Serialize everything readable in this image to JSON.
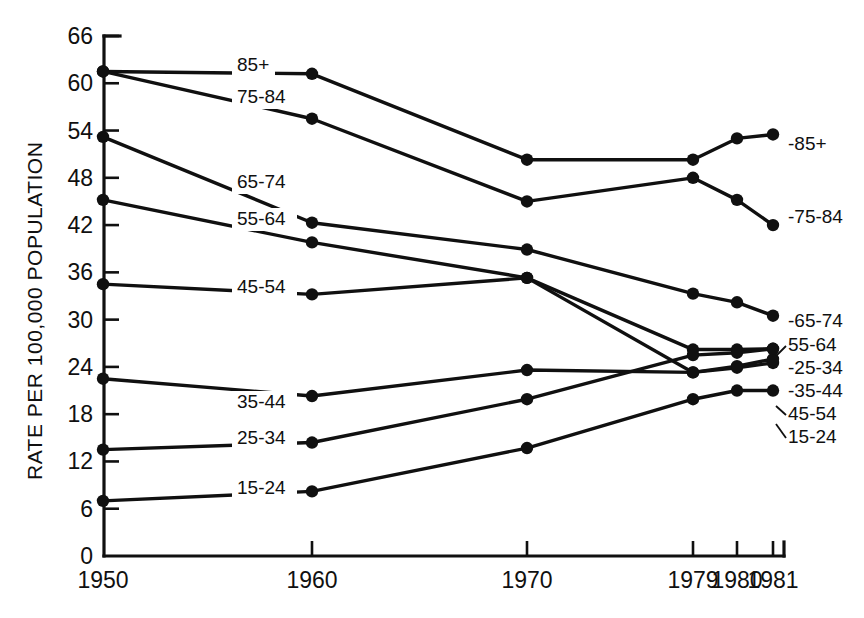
{
  "chart_data": {
    "type": "line",
    "title": "",
    "subtitle": "",
    "xlabel": "",
    "ylabel": "RATE PER 100,000 POPULATION",
    "x": [
      "1950",
      "1960",
      "1970",
      "1979",
      "1980",
      "1981"
    ],
    "xtick_labels": [
      "1950",
      "1960",
      "1970",
      "1979",
      "1980",
      "1981"
    ],
    "ytick_labels": [
      "0",
      "6",
      "12",
      "18",
      "24",
      "30",
      "36",
      "42",
      "48",
      "54",
      "60",
      "66"
    ],
    "ylim": [
      0,
      66
    ],
    "grid": false,
    "legend_position": "inline-and-right",
    "marker": "filled-circle",
    "line_color": "#101010",
    "series": [
      {
        "name": "85+",
        "inline_label": "85+",
        "right_label": "-85+",
        "values": [
          61.5,
          61.2,
          50.3,
          50.3,
          53.0,
          53.5
        ]
      },
      {
        "name": "75-84",
        "inline_label": "75-84",
        "right_label": "-75-84",
        "values": [
          61.5,
          55.5,
          45.0,
          48.0,
          45.2,
          42.0
        ]
      },
      {
        "name": "65-74",
        "inline_label": "65-74",
        "right_label": "-65-74",
        "values": [
          53.2,
          42.3,
          38.9,
          33.3,
          32.2,
          30.5
        ]
      },
      {
        "name": "55-64",
        "inline_label": "55-64",
        "right_label": "55-64",
        "values": [
          45.2,
          39.8,
          35.3,
          26.2,
          26.2,
          26.3
        ]
      },
      {
        "name": "45-54",
        "inline_label": "45-54",
        "right_label": "45-54",
        "values": [
          34.5,
          33.2,
          35.3,
          23.3,
          23.9,
          24.5
        ]
      },
      {
        "name": "35-44",
        "inline_label": "35-44",
        "right_label": "-35-44",
        "values": [
          22.5,
          20.3,
          23.6,
          23.3,
          24.1,
          25.0
        ]
      },
      {
        "name": "25-34",
        "inline_label": "25-34",
        "right_label": "-25-34",
        "values": [
          13.5,
          14.4,
          19.9,
          25.5,
          25.8,
          26.3
        ]
      },
      {
        "name": "15-24",
        "inline_label": "15-24",
        "right_label": "15-24",
        "values": [
          7.0,
          8.2,
          13.7,
          19.9,
          21.0,
          21.0
        ]
      }
    ]
  },
  "axes": {
    "x_positions": [
      103,
      312,
      527,
      693,
      737,
      773
    ],
    "y_value_to_px": {
      "zero_px": 556,
      "px_per_unit": 7.879
    },
    "plot_left": 104,
    "plot_top": 36,
    "plot_bottom": 556
  },
  "inline_labels": [
    {
      "text": "85+",
      "x": 237,
      "y": 71
    },
    {
      "text": "75-84",
      "x": 237,
      "y": 103
    },
    {
      "text": "65-74",
      "x": 237,
      "y": 188
    },
    {
      "text": "55-64",
      "x": 237,
      "y": 225
    },
    {
      "text": "45-54",
      "x": 237,
      "y": 293
    },
    {
      "text": "35-44",
      "x": 237,
      "y": 408
    },
    {
      "text": "25-34",
      "x": 237,
      "y": 444
    },
    {
      "text": "15-24",
      "x": 237,
      "y": 494
    }
  ],
  "right_labels": [
    {
      "text": "-85+",
      "x": 788,
      "y": 150
    },
    {
      "text": "-75-84",
      "x": 788,
      "y": 223
    },
    {
      "text": "-65-74",
      "x": 788,
      "y": 327
    },
    {
      "text": "55-64",
      "x": 788,
      "y": 351
    },
    {
      "text": "-25-34",
      "x": 788,
      "y": 374
    },
    {
      "text": "-35-44",
      "x": 788,
      "y": 397
    },
    {
      "text": "45-54",
      "x": 788,
      "y": 420
    },
    {
      "text": "15-24",
      "x": 788,
      "y": 443
    }
  ]
}
